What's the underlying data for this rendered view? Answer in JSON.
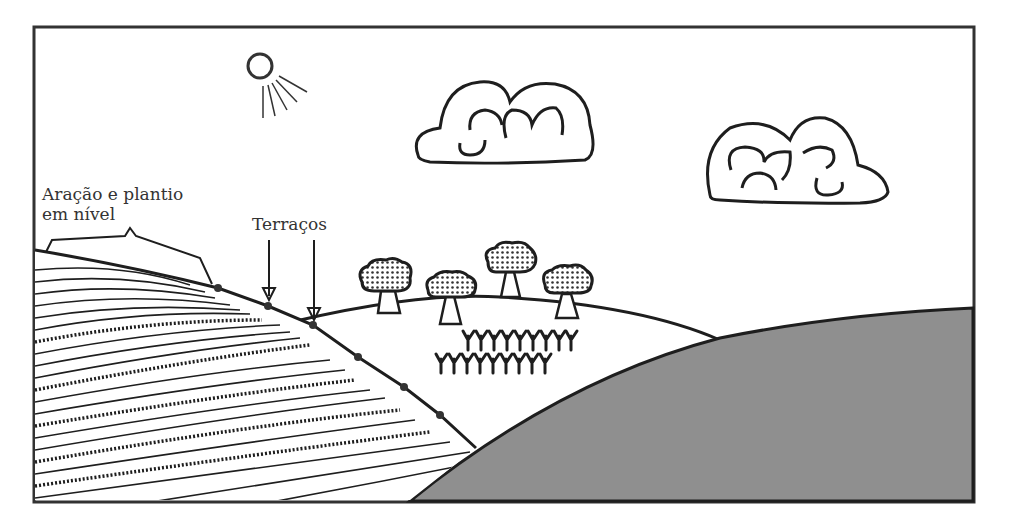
{
  "figure": {
    "labels": {
      "contour_line1": "Aração e plantio",
      "contour_line2": "em nível",
      "terraces": "Terraços"
    },
    "elements": {
      "sun": "sun-icon",
      "clouds": 2,
      "trees": 4,
      "crop_rows": 2,
      "terrace_markers": 6
    },
    "colors": {
      "stroke": "#1e1e1e",
      "ground_gray": "#8f8f8f",
      "background": "#ffffff",
      "text": "#333333"
    }
  }
}
